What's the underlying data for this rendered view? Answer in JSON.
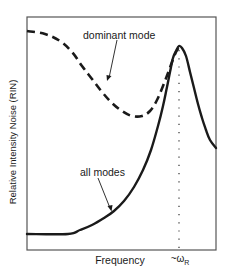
{
  "chart_data": {
    "type": "line",
    "title": "",
    "xlabel": "Frequency",
    "ylabel": "Relative Intensity Noise (RIN)",
    "x_ticks": [
      {
        "label": "~ω",
        "subscript": "R",
        "position": "resonance frequency"
      }
    ],
    "grid": false,
    "legend": null,
    "units": "arbitrary (qualitative sketch)",
    "series": [
      {
        "name": "dominant mode",
        "style": "dashed",
        "color": "#1a1a1a",
        "description": "High at low frequency, decreases to a minimum, then rises sharply toward the resonance peak",
        "points_px": [
          [
            27,
            31
          ],
          [
            45,
            34
          ],
          [
            60,
            41
          ],
          [
            72,
            52
          ],
          [
            82,
            66
          ],
          [
            92,
            79
          ],
          [
            102,
            92
          ],
          [
            112,
            103
          ],
          [
            122,
            111
          ],
          [
            132,
            116
          ],
          [
            142,
            116
          ],
          [
            150,
            111
          ],
          [
            157,
            100
          ],
          [
            163,
            86
          ],
          [
            168,
            73
          ],
          [
            172,
            62
          ],
          [
            176,
            52
          ],
          [
            179,
            47
          ]
        ]
      },
      {
        "name": "all modes",
        "style": "solid",
        "color": "#1a1a1a",
        "description": "Flat at low frequency, rises monotonically to a sharp peak at ~ωR, then falls",
        "points_px": [
          [
            27,
            234
          ],
          [
            68,
            234
          ],
          [
            80,
            230
          ],
          [
            92,
            225
          ],
          [
            104,
            218
          ],
          [
            114,
            211
          ],
          [
            124,
            201
          ],
          [
            134,
            187
          ],
          [
            143,
            170
          ],
          [
            151,
            150
          ],
          [
            158,
            126
          ],
          [
            163,
            106
          ],
          [
            167,
            87
          ],
          [
            170,
            72
          ],
          [
            173,
            58
          ],
          [
            176,
            51
          ],
          [
            179,
            46
          ],
          [
            182,
            48
          ],
          [
            186,
            56
          ],
          [
            190,
            72
          ],
          [
            194,
            88
          ],
          [
            198,
            104
          ],
          [
            202,
            118
          ],
          [
            206,
            130
          ],
          [
            210,
            140
          ],
          [
            216,
            148
          ]
        ]
      }
    ],
    "annotations": [
      {
        "text": "dominant mode",
        "arrow_to_series": "dominant mode"
      },
      {
        "text": "all modes",
        "arrow_to_series": "all modes"
      },
      {
        "text": "dotted vertical line at resonance frequency ~ωR"
      }
    ]
  },
  "labels": {
    "ylabel": "Relative Intensity Noise (RIN)",
    "xlabel": "Frequency",
    "tick_main": "~ω",
    "tick_sub": "R",
    "annot_dominant": "dominant mode",
    "annot_all": "all modes"
  },
  "colors": {
    "ink": "#1a1a1a",
    "frame": "#444444",
    "background": "#ffffff"
  }
}
